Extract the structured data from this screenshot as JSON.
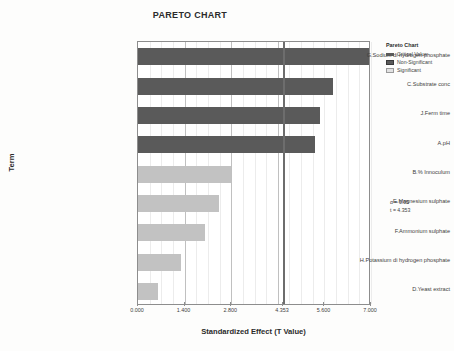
{
  "chart_data": {
    "type": "bar",
    "orientation": "horizontal",
    "title": "PARETO CHART",
    "xlabel": "Standardized Effect (T Value)",
    "ylabel": "Term",
    "categories": [
      "G.Sodium di hydrogen phosphate",
      "C.Substrate conc",
      "J.Ferm time",
      "A.pH",
      "B.% Innoculum",
      "E.Magnesium sulphate",
      "F.Ammonium sulphate",
      "H.Potassium di hydrogen phosphate",
      "D.Yeast extract"
    ],
    "values": [
      6.93,
      5.85,
      5.48,
      5.33,
      2.79,
      2.43,
      2.02,
      1.29,
      0.6
    ],
    "significant": [
      true,
      true,
      true,
      true,
      false,
      false,
      false,
      false,
      false
    ],
    "xlim": [
      0.0,
      7.0
    ],
    "xticks": [
      "0.000",
      "1.400",
      "2.800",
      "4.353",
      "5.600",
      "7.000"
    ],
    "xtick_values": [
      0.0,
      1.4,
      2.8,
      4.353,
      5.6,
      7.0
    ],
    "critical_value": 4.353,
    "grid": true,
    "legend_position": "right"
  },
  "legend": {
    "title": "Pareto Chart",
    "items": [
      {
        "label": "Critical Value",
        "swatch": "critical"
      },
      {
        "label": "Non-Significant",
        "swatch": "nonsig"
      },
      {
        "label": "Significant",
        "swatch": "sig"
      }
    ]
  },
  "annotation": {
    "alpha": "α = 0.05",
    "t": "t = 4.353"
  },
  "colors": {
    "significant_bar": "#5a5a5a",
    "nonsignificant_bar": "#c2c2c2",
    "critical_line": "#6d6d6d",
    "grid": "#d6d6d6",
    "frame": "#8d8d8d"
  }
}
